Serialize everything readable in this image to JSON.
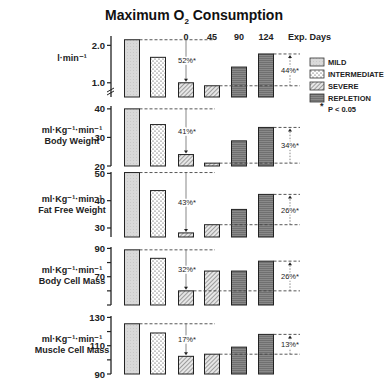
{
  "chart_data": {
    "type": "bar",
    "title": "Maximum O2 Consumption",
    "title_main": "Maximum O",
    "title_sub": "2",
    "title_end": " Consumption",
    "categories": [
      "MILD",
      "INTERMEDIATE",
      "SEVERE",
      "45",
      "90",
      "124"
    ],
    "phase_groups": [
      "MILD",
      "INTERMEDIATE",
      "SEVERE",
      "SEVERE",
      "REPLETION",
      "REPLETION"
    ],
    "exp_days_header": {
      "days": [
        "0",
        "45",
        "90",
        "124"
      ],
      "label": "Exp. Days"
    },
    "legend": {
      "position": "right",
      "items": [
        {
          "label": "MILD",
          "pattern": "light-gray"
        },
        {
          "label": "INTERMEDIATE",
          "pattern": "dots"
        },
        {
          "label": "SEVERE",
          "pattern": "diagonal-hatch"
        },
        {
          "label": "REPLETION",
          "pattern": "horizontal-lines-dark"
        }
      ],
      "significance": {
        "star": "*",
        "label": "P < 0.05"
      }
    },
    "panels": [
      {
        "label_line1": "l·min⁻¹",
        "label_line2": "",
        "ylim": [
          0.62,
          2.25
        ],
        "ticks": [
          {
            "v": 1.0,
            "t": "1.0"
          },
          {
            "v": 2.0,
            "t": "2.0"
          }
        ],
        "minor_ticks": [],
        "axis_break": true,
        "values": [
          2.15,
          1.68,
          1.0,
          0.92,
          1.42,
          1.77
        ],
        "decrease": {
          "label": "52%*",
          "from": 0,
          "to": 2
        },
        "increase": {
          "label": "44%*",
          "from": 3,
          "to": 5
        }
      },
      {
        "label_line1": "ml·Kg⁻¹·min⁻¹",
        "label_line2": "Body Weight",
        "ylim": [
          20,
          41
        ],
        "ticks": [
          {
            "v": 20,
            "t": "20"
          },
          {
            "v": 30,
            "t": "30"
          },
          {
            "v": 40,
            "t": "40"
          }
        ],
        "minor_ticks": [],
        "axis_break": false,
        "values": [
          40,
          34.5,
          24,
          21,
          28.8,
          33.5
        ],
        "decrease": {
          "label": "41%*",
          "from": 0,
          "to": 2
        },
        "increase": {
          "label": "34%*",
          "from": 3,
          "to": 5
        }
      },
      {
        "label_line1": "ml·Kg⁻¹·min⁻¹",
        "label_line2": "Fat Free Weight",
        "ylim": [
          26.7,
          50.5
        ],
        "ticks": [
          {
            "v": 30,
            "t": "30"
          },
          {
            "v": 40,
            "t": "40"
          },
          {
            "v": 50,
            "t": "50"
          }
        ],
        "minor_ticks": [],
        "axis_break": false,
        "values": [
          50.3,
          43.7,
          28.2,
          31.2,
          36.8,
          42.3
        ],
        "decrease": {
          "label": "43%*",
          "from": 0,
          "to": 2
        },
        "increase": {
          "label": "26%*",
          "from": 3,
          "to": 5
        }
      },
      {
        "label_line1": "ml·Kg⁻¹·min⁻¹",
        "label_line2": "Body Cell Mass",
        "ylim": [
          50,
          91
        ],
        "ticks": [
          {
            "v": 70,
            "t": "70"
          },
          {
            "v": 90,
            "t": "90"
          }
        ],
        "minor_ticks": [
          50,
          60,
          80
        ],
        "axis_break": false,
        "values": [
          89,
          83,
          60,
          74,
          74,
          81
        ],
        "decrease": {
          "label": "32%*",
          "from": 0,
          "to": 2
        },
        "increase": {
          "label": "26%*",
          "from": 2,
          "to": 5
        }
      },
      {
        "label_line1": "ml·Kg⁻¹·min⁻¹",
        "label_line2": "Muscle Cell Mass",
        "ylim": [
          90,
          131
        ],
        "ticks": [
          {
            "v": 90,
            "t": "90"
          },
          {
            "v": 110,
            "t": "110"
          },
          {
            "v": 130,
            "t": "130"
          }
        ],
        "minor_ticks": [
          100,
          120
        ],
        "axis_break": false,
        "values": [
          125.5,
          119,
          102.5,
          104,
          109,
          118
        ],
        "decrease": {
          "label": "17%*",
          "from": 0,
          "to": 2
        },
        "increase": {
          "label": "13%*",
          "from": 3,
          "to": 5
        }
      }
    ]
  }
}
